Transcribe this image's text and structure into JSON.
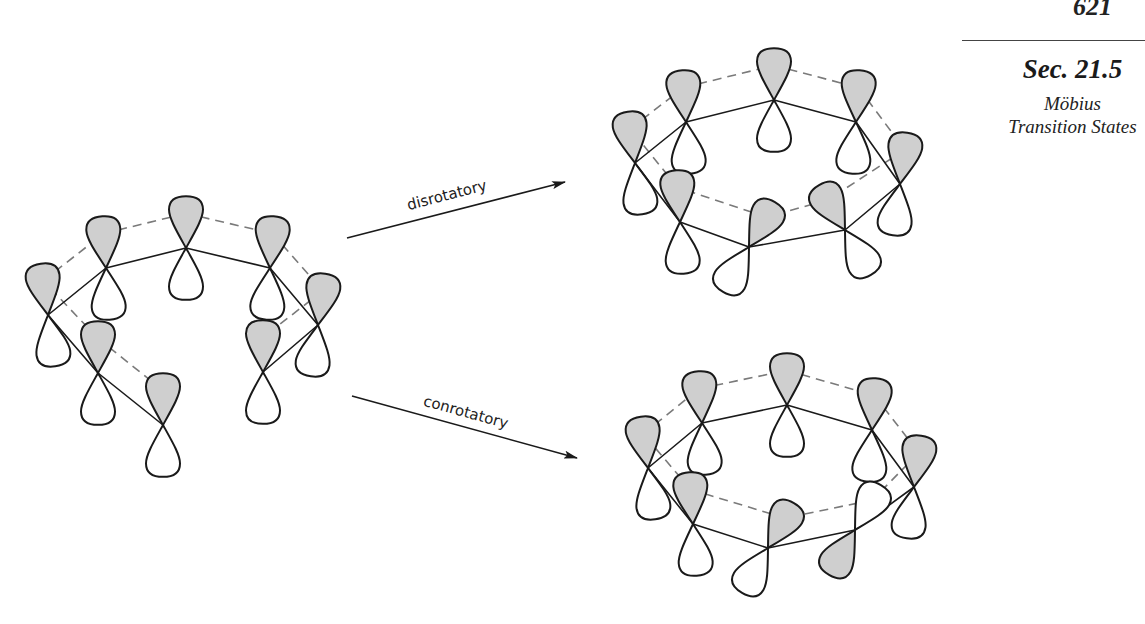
{
  "header": {
    "page_number": "621",
    "section": "Sec. 21.5",
    "section_subtitle_line1": "Möbius",
    "section_subtitle_line2": "Transition States"
  },
  "figure": {
    "arrows": [
      {
        "label": "disrotatory",
        "from": [
          347,
          238
        ],
        "to": [
          565,
          182
        ]
      },
      {
        "label": "conrotatory",
        "from": [
          352,
          396
        ],
        "to": [
          577,
          458
        ]
      }
    ],
    "colors": {
      "shaded_lobe": "#cfcfcf",
      "outline": "#1a1a1a",
      "dash": "#7a7a7a"
    },
    "structures": [
      {
        "name": "reactant-polyene",
        "description": "open-chain polyene, 8 p orbitals, shaded lobes up",
        "orbitals": [
          {
            "x": 163,
            "y": 425,
            "angle": 0,
            "shaded_top": true
          },
          {
            "x": 98,
            "y": 373,
            "angle": 0,
            "shaded_top": true
          },
          {
            "x": 48,
            "y": 315,
            "angle": -8,
            "shaded_top": true
          },
          {
            "x": 106,
            "y": 268,
            "angle": -4,
            "shaded_top": true
          },
          {
            "x": 186,
            "y": 248,
            "angle": 0,
            "shaded_top": true
          },
          {
            "x": 270,
            "y": 268,
            "angle": 4,
            "shaded_top": true
          },
          {
            "x": 318,
            "y": 325,
            "angle": 8,
            "shaded_top": true
          },
          {
            "x": 263,
            "y": 372,
            "angle": 0,
            "shaded_top": true
          }
        ],
        "bonds": [
          [
            0,
            1
          ],
          [
            1,
            2
          ],
          [
            2,
            3
          ],
          [
            3,
            4
          ],
          [
            4,
            5
          ],
          [
            5,
            6
          ],
          [
            6,
            7
          ]
        ],
        "dashed": [
          [
            0,
            1
          ],
          [
            1,
            2
          ],
          [
            2,
            3
          ],
          [
            3,
            4
          ],
          [
            4,
            5
          ],
          [
            5,
            6
          ],
          [
            6,
            7
          ]
        ]
      },
      {
        "name": "disrotatory-product",
        "description": "closed ring, termini rotated same sense, in-phase overlap",
        "orbitals": [
          {
            "x": 749,
            "y": 247,
            "angle": 30,
            "shaded_top": true
          },
          {
            "x": 680,
            "y": 222,
            "angle": -4,
            "shaded_top": true
          },
          {
            "x": 635,
            "y": 163,
            "angle": -8,
            "shaded_top": true
          },
          {
            "x": 686,
            "y": 122,
            "angle": -4,
            "shaded_top": true
          },
          {
            "x": 774,
            "y": 100,
            "angle": 0,
            "shaded_top": true
          },
          {
            "x": 856,
            "y": 122,
            "angle": 4,
            "shaded_top": true
          },
          {
            "x": 900,
            "y": 184,
            "angle": 8,
            "shaded_top": true
          },
          {
            "x": 845,
            "y": 230,
            "angle": -30,
            "shaded_top": true
          }
        ],
        "bonds": [
          [
            0,
            1
          ],
          [
            1,
            2
          ],
          [
            2,
            3
          ],
          [
            3,
            4
          ],
          [
            4,
            5
          ],
          [
            5,
            6
          ],
          [
            6,
            7
          ],
          [
            7,
            0
          ]
        ],
        "dashed": [
          [
            0,
            1
          ],
          [
            1,
            2
          ],
          [
            2,
            3
          ],
          [
            3,
            4
          ],
          [
            4,
            5
          ],
          [
            5,
            6
          ],
          [
            6,
            7
          ],
          [
            7,
            0
          ]
        ]
      },
      {
        "name": "conrotatory-product",
        "description": "closed ring, termini rotated opposite sense, Möbius array",
        "orbitals": [
          {
            "x": 768,
            "y": 548,
            "angle": 30,
            "shaded_top": true
          },
          {
            "x": 693,
            "y": 524,
            "angle": -4,
            "shaded_top": true
          },
          {
            "x": 648,
            "y": 468,
            "angle": -8,
            "shaded_top": true
          },
          {
            "x": 702,
            "y": 423,
            "angle": -4,
            "shaded_top": true
          },
          {
            "x": 787,
            "y": 405,
            "angle": 0,
            "shaded_top": true
          },
          {
            "x": 872,
            "y": 430,
            "angle": 4,
            "shaded_top": true
          },
          {
            "x": 914,
            "y": 487,
            "angle": 8,
            "shaded_top": true
          },
          {
            "x": 855,
            "y": 530,
            "angle": 30,
            "shaded_top": false
          }
        ],
        "bonds": [
          [
            0,
            1
          ],
          [
            1,
            2
          ],
          [
            2,
            3
          ],
          [
            3,
            4
          ],
          [
            4,
            5
          ],
          [
            5,
            6
          ],
          [
            6,
            7
          ],
          [
            7,
            0
          ]
        ],
        "dashed": [
          [
            0,
            1
          ],
          [
            1,
            2
          ],
          [
            2,
            3
          ],
          [
            3,
            4
          ],
          [
            4,
            5
          ],
          [
            5,
            6
          ],
          [
            6,
            7
          ],
          [
            7,
            0
          ]
        ]
      }
    ]
  }
}
